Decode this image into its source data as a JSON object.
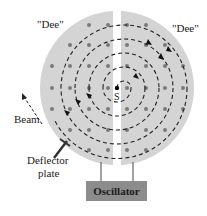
{
  "labels": {
    "dee_left": "\"Dee\"",
    "dee_right": "\"Dee\"",
    "source": "S",
    "beam": "Beam",
    "deflector_line1": "Deflector",
    "deflector_line2": "plate",
    "oscillator": "Oscillator"
  },
  "colors": {
    "dee_fill": "#d4d4d4",
    "path_stroke": "#222222",
    "field_dot": "#7a7a7a",
    "oscillator_fill": "#8c8c8c",
    "background": "#ffffff"
  },
  "geometry": {
    "center": [
      117,
      88
    ],
    "disc_radius": 77,
    "gap_half_width": 4,
    "orbit_radii": [
      14,
      28,
      42,
      56,
      70
    ]
  },
  "components": [
    "Dee (left)",
    "Dee (right)",
    "Source S",
    "Magnetic field dots",
    "Spiral particle path",
    "Beam exit",
    "Deflector plate",
    "Oscillator"
  ]
}
